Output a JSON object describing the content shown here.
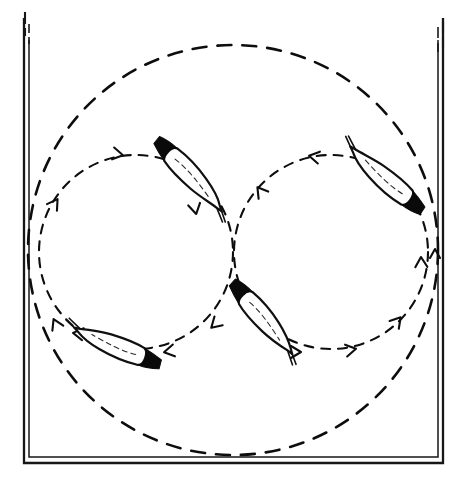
{
  "figure": {
    "type": "scientific-line-drawing",
    "background_color": "#ffffff",
    "ink_color": "#0d0d0d",
    "canvas": {
      "width": 467,
      "height": 492
    }
  },
  "frame": {
    "name": "vessel-frame",
    "description": "rectangular chamber outline, drawn as a doubled hand-inked line, open at the top",
    "stroke_color": "#171717",
    "left_x": 24,
    "right_x": 443,
    "bottom_y": 463,
    "top_y": 18,
    "double_line_offset": 5
  },
  "tracks": {
    "outer_circle": {
      "name": "outer-dashed-orbit",
      "cx": 233,
      "cy": 250,
      "r": 205,
      "dash": "14 11",
      "stroke_width": 2.6,
      "stroke_color": "#0d0d0d"
    },
    "left_circle": {
      "name": "left-dashed-orbit",
      "cx": 136,
      "cy": 252,
      "r": 97,
      "dash": "9 8",
      "stroke_width": 2.1,
      "stroke_color": "#0d0d0d",
      "direction": "clockwise"
    },
    "right_circle": {
      "name": "right-dashed-orbit",
      "cx": 331,
      "cy": 252,
      "r": 97,
      "dash": "9 8",
      "stroke_width": 2.1,
      "stroke_color": "#0d0d0d",
      "direction": "counter-clockwise"
    },
    "tangent_point": {
      "x": 233,
      "y": 252
    }
  },
  "arrows": [
    {
      "name": "arrow-left-orbit-top",
      "x": 122,
      "y": 155,
      "angle": 10,
      "track": "left-dashed-orbit"
    },
    {
      "name": "arrow-left-orbit-west",
      "x": 57,
      "y": 200,
      "angle": -56,
      "track": "left-dashed-orbit"
    },
    {
      "name": "arrow-left-orbit-inner",
      "x": 196,
      "y": 213,
      "angle": 78,
      "track": "left-dashed-orbit"
    },
    {
      "name": "arrow-left-orbit-south",
      "x": 212,
      "y": 327,
      "angle": 137,
      "track": "left-dashed-orbit"
    },
    {
      "name": "arrow-left-orbit-bottom",
      "x": 165,
      "y": 352,
      "angle": 170,
      "track": "left-dashed-orbit"
    },
    {
      "name": "arrow-left-orbit-sw",
      "x": 74,
      "y": 333,
      "angle": 188,
      "track": "left-dashed-orbit"
    },
    {
      "name": "arrow-right-orbit-top",
      "x": 310,
      "y": 156,
      "angle": 190,
      "track": "right-dashed-orbit"
    },
    {
      "name": "arrow-right-orbit-nw",
      "x": 258,
      "y": 188,
      "angle": 233,
      "track": "right-dashed-orbit"
    },
    {
      "name": "arrow-right-orbit-east",
      "x": 421,
      "y": 258,
      "angle": -92,
      "track": "right-dashed-orbit"
    },
    {
      "name": "arrow-right-orbit-se",
      "x": 400,
      "y": 318,
      "angle": -50,
      "track": "right-dashed-orbit"
    },
    {
      "name": "arrow-right-orbit-south",
      "x": 355,
      "y": 349,
      "angle": -10,
      "track": "right-dashed-orbit"
    },
    {
      "name": "arrow-right-orbit-sw",
      "x": 300,
      "y": 352,
      "angle": 0,
      "track": "right-dashed-orbit"
    }
  ],
  "organisms": [
    {
      "name": "organism-top-left",
      "label": "spindle cell on left orbit, upper arc",
      "head_x": 168,
      "head_y": 152,
      "tail_x": 221,
      "tail_y": 205,
      "width": 17,
      "head_end": "upper-left",
      "orientation_deg": 45
    },
    {
      "name": "organism-top-right",
      "label": "spindle cell on right orbit, upper arc",
      "head_x": 410,
      "head_y": 200,
      "tail_x": 350,
      "tail_y": 152,
      "width": 17,
      "head_end": "lower-right",
      "orientation_deg": 219
    },
    {
      "name": "organism-bottom-left",
      "label": "spindle cell on left orbit, lower arc",
      "head_x": 145,
      "head_y": 358,
      "tail_x": 71,
      "tail_y": 329,
      "width": 16,
      "head_end": "right",
      "orientation_deg": 201
    },
    {
      "name": "organism-bottom-center",
      "label": "spindle cell on right orbit, lower arc",
      "head_x": 243,
      "head_y": 295,
      "tail_x": 295,
      "tail_y": 353,
      "width": 16,
      "head_end": "upper-left",
      "orientation_deg": 48
    }
  ]
}
